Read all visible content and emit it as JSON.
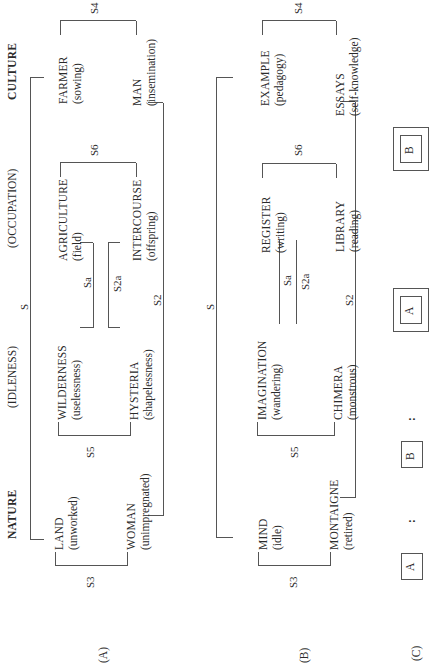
{
  "diagram": {
    "headers": {
      "nature": "NATURE",
      "idleness": "(IDLENESS)",
      "occupation": "(OCCUPATION)",
      "culture": "CULTURE"
    },
    "panel_a": {
      "label": "(A)",
      "nodes": {
        "land": {
          "main": "LAND",
          "sub": "(unworked)"
        },
        "woman": {
          "main": "WOMAN",
          "sub": "(unimpregnated)"
        },
        "wilderness": {
          "main": "WILDERNESS",
          "sub": "(uselessness)"
        },
        "hysteria": {
          "main": "HYSTERIA",
          "sub": "(shapelessness)"
        },
        "agriculture": {
          "main": "AGRICULTURE",
          "sub": "(field)"
        },
        "intercourse": {
          "main": "INTERCOURSE",
          "sub": "(offspring)"
        },
        "farmer": {
          "main": "FARMER",
          "sub": "(sowing)"
        },
        "man": {
          "main": "MAN",
          "sub": "(insemination)"
        }
      },
      "relations": {
        "s": "S",
        "s2": "S2",
        "s3": "S3",
        "s4": "S4",
        "s5": "S5",
        "s6": "S6",
        "sa": "Sa",
        "s2a": "S2a"
      }
    },
    "panel_b": {
      "label": "(B)",
      "nodes": {
        "mind": {
          "main": "MIND",
          "sub": "(idle)"
        },
        "montaigne": {
          "main": "MONTAIGNE",
          "sub": "(retired)"
        },
        "imagination": {
          "main": "IMAGINATION",
          "sub": "(wandering)"
        },
        "chimera": {
          "main": "CHIMERA",
          "sub": "(monstrous)"
        },
        "register": {
          "main": "REGISTER",
          "sub": "(writing)"
        },
        "library": {
          "main": "LIBRARY",
          "sub": "(reading)"
        },
        "example": {
          "main": "EXAMPLE",
          "sub": "(pedagogy)"
        },
        "essays": {
          "main": "ESSAYS",
          "sub": "(self-knowledge)"
        }
      },
      "relations": {
        "s": "S",
        "s2": "S2",
        "s3": "S3",
        "s4": "S4",
        "s5": "S5",
        "s6": "S6",
        "sa": "Sa",
        "s2a": "S2a"
      }
    },
    "panel_c": {
      "label": "(C)",
      "formula": [
        {
          "type": "box",
          "text": "A"
        },
        {
          "type": "sep",
          "text": ":"
        },
        {
          "type": "box",
          "text": "B"
        },
        {
          "type": "sep",
          "text": ":"
        },
        {
          "type": "nested-box",
          "text": "A"
        },
        {
          "type": "nested-box",
          "text": "B"
        }
      ]
    }
  }
}
